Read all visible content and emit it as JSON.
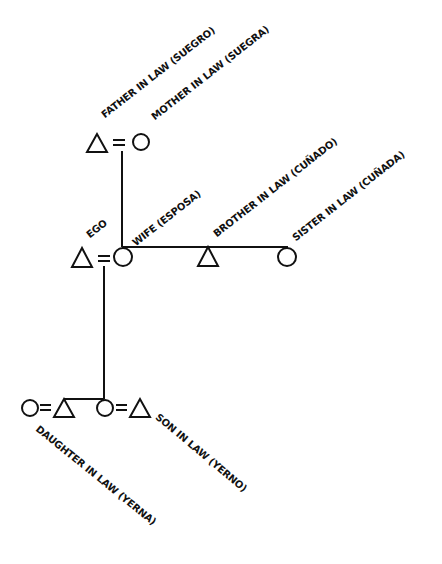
{
  "diagram": {
    "type": "kinship-chart",
    "stroke_color": "#111111",
    "background": "#ffffff",
    "labels": {
      "father_in_law": "FATHER IN LAW (SUEGRO)",
      "mother_in_law": "MOTHER IN LAW (SUEGRA)",
      "ego": "EGO",
      "wife": "WIFE (ESPOSA)",
      "brother_in_law": "BROTHER IN LAW (CUÑADO)",
      "sister_in_law": "SISTER IN LAW (CUÑADA)",
      "daughter_in_law": "DAUGHTER IN LAW (YERNA)",
      "son_in_law": "SON IN LAW (YERNO)"
    },
    "nodes": [
      {
        "id": "father_in_law",
        "shape": "triangle",
        "sex": "male"
      },
      {
        "id": "mother_in_law",
        "shape": "circle",
        "sex": "female"
      },
      {
        "id": "ego",
        "shape": "triangle",
        "sex": "male"
      },
      {
        "id": "wife",
        "shape": "circle",
        "sex": "female"
      },
      {
        "id": "brother_in_law",
        "shape": "triangle",
        "sex": "male"
      },
      {
        "id": "sister_in_law",
        "shape": "circle",
        "sex": "female"
      },
      {
        "id": "daughter_in_law",
        "shape": "circle",
        "sex": "female"
      },
      {
        "id": "son",
        "shape": "triangle",
        "sex": "male"
      },
      {
        "id": "daughter",
        "shape": "circle",
        "sex": "female"
      },
      {
        "id": "son_in_law",
        "shape": "triangle",
        "sex": "male"
      }
    ],
    "marriages": [
      [
        "father_in_law",
        "mother_in_law"
      ],
      [
        "ego",
        "wife"
      ],
      [
        "daughter_in_law",
        "son"
      ],
      [
        "daughter",
        "son_in_law"
      ]
    ],
    "descent": [
      {
        "parents": [
          "father_in_law",
          "mother_in_law"
        ],
        "children": [
          "wife",
          "brother_in_law",
          "sister_in_law"
        ]
      },
      {
        "parents": [
          "ego",
          "wife"
        ],
        "children": [
          "son",
          "daughter"
        ]
      }
    ]
  }
}
